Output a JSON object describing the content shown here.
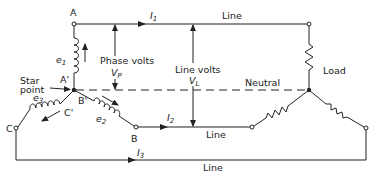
{
  "diagram": {
    "labels": {
      "terminal_a": "A",
      "terminal_a_prime": "A'",
      "terminal_b": "B",
      "terminal_b_prime": "B'",
      "terminal_c": "C",
      "terminal_c_prime": "C'",
      "emf_1": "e",
      "emf_1_sub": "1",
      "emf_2": "e",
      "emf_2_sub": "2",
      "emf_3": "e",
      "emf_3_sub": "3",
      "current_1": "I",
      "current_1_sub": "1",
      "current_2": "I",
      "current_2_sub": "2",
      "current_3": "I",
      "current_3_sub": "3",
      "star_point_line1": "Star",
      "star_point_line2": "point",
      "phase_volts": "Phase volts",
      "phase_volts_symbol": "V",
      "phase_volts_sub": "P",
      "line_volts": "Line volts",
      "line_volts_symbol": "V",
      "line_volts_sub": "L",
      "line_top": "Line",
      "line_middle": "Line",
      "line_bottom": "Line",
      "neutral": "Neutral",
      "load": "Load"
    },
    "colors": {
      "stroke": "#222222",
      "background": "#ffffff"
    }
  }
}
